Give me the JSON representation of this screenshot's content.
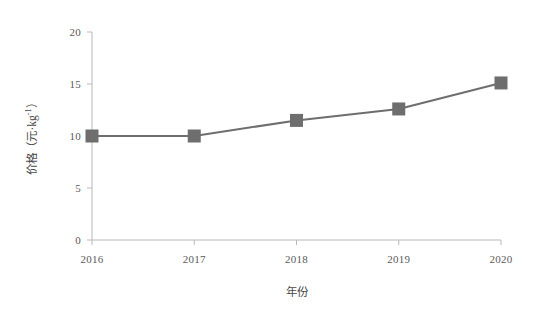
{
  "chart_data": {
    "type": "line",
    "title": "",
    "subtitle": "",
    "xlabel": "年份",
    "ylabel": "价格（元·kg⁻¹）",
    "ylabel_parts": {
      "main": "价格（元·kg",
      "superscript": "-1",
      "tail": "）"
    },
    "categories": [
      "2016",
      "2017",
      "2018",
      "2019",
      "2020"
    ],
    "x": [
      2016,
      2017,
      2018,
      2019,
      2020
    ],
    "values": [
      10.0,
      10.0,
      11.5,
      12.6,
      15.1
    ],
    "series": [
      {
        "name": "价格",
        "values": [
          10.0,
          10.0,
          11.5,
          12.6,
          15.1
        ],
        "color": "#6e6e6e",
        "marker": "square",
        "marker_size": 13,
        "line_width": 2
      }
    ],
    "xlim": [
      2016,
      2020
    ],
    "ylim": [
      0,
      20
    ],
    "yticks": [
      0,
      5,
      10,
      15,
      20
    ],
    "ytick_labels": [
      "0",
      "5",
      "10",
      "15",
      "20"
    ],
    "xticks": [
      2016,
      2017,
      2018,
      2019,
      2020
    ],
    "xtick_labels": [
      "2016",
      "2017",
      "2018",
      "2019",
      "2020"
    ],
    "grid": false,
    "legend": false,
    "legend_position": "none",
    "axis_color": "#b8b8b8",
    "background": "#ffffff"
  },
  "plot_geometry": {
    "left": 92,
    "right": 501,
    "top": 32,
    "bottom": 240
  }
}
